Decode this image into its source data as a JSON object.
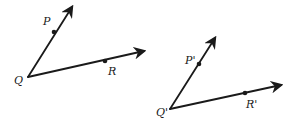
{
  "diagram": {
    "stroke_color": "#1a1a1a",
    "angles": [
      {
        "name": "angle-PQR",
        "vertex": {
          "label": "Q",
          "x": 28,
          "y": 77,
          "label_x": 14,
          "label_y": 84
        },
        "ray1": {
          "through": {
            "label": "P",
            "x": 54,
            "y": 32,
            "label_x": 43,
            "label_y": 25
          },
          "tip": {
            "x": 72,
            "y": 7
          }
        },
        "ray2": {
          "through": {
            "label": "R",
            "x": 105,
            "y": 61,
            "label_x": 108,
            "label_y": 75
          },
          "tip": {
            "x": 144,
            "y": 51
          }
        }
      },
      {
        "name": "angle-PprimeQprimeRprime",
        "vertex": {
          "label": "Q'",
          "x": 170,
          "y": 109,
          "label_x": 156,
          "label_y": 116
        },
        "ray1": {
          "through": {
            "label": "P'",
            "x": 199,
            "y": 64,
            "label_x": 185,
            "label_y": 64
          },
          "tip": {
            "x": 215,
            "y": 38
          }
        },
        "ray2": {
          "through": {
            "label": "R'",
            "x": 245,
            "y": 93,
            "label_x": 246,
            "label_y": 108
          },
          "tip": {
            "x": 281,
            "y": 85
          }
        }
      }
    ]
  }
}
